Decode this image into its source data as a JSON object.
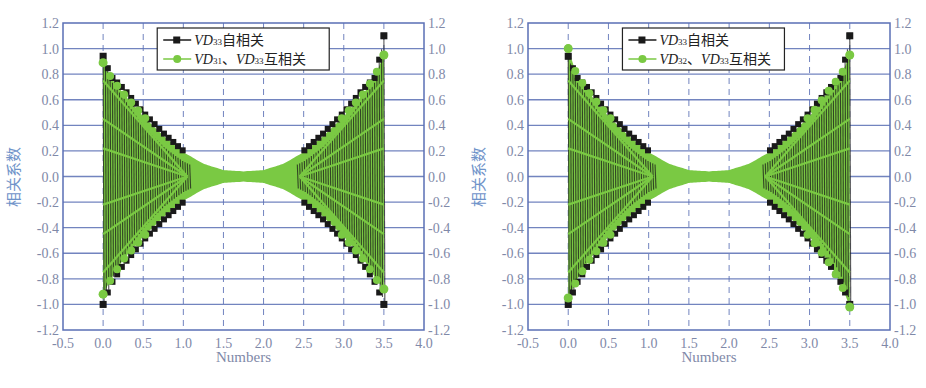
{
  "colors": {
    "axis": "#5a6fb5",
    "grid_h": "#5a6fb5",
    "grid_v": "#5a6fb5",
    "tick_text": "#7f89a8",
    "ylabel_text": "#6f93c9",
    "series_auto": "#1a1a1a",
    "series_cross": "#7ac943",
    "legend_border": "#222222"
  },
  "chart_data": [
    {
      "type": "line",
      "title": "",
      "xlabel": "Numbers",
      "ylabel": "相关系数",
      "xlim": [
        -0.5,
        4.0
      ],
      "ylim": [
        -1.2,
        1.2
      ],
      "xticks": [
        "-0.5",
        "0.0",
        "0.5",
        "1.0",
        "1.5",
        "2.0",
        "2.5",
        "3.0",
        "3.5",
        "4.0"
      ],
      "yticks": [
        "1.2",
        "1.0",
        "0.8",
        "0.6",
        "0.4",
        "0.2",
        "0.0",
        "-0.2",
        "-0.4",
        "-0.6",
        "-0.8",
        "-1.0",
        "-1.2"
      ],
      "grid": true,
      "legend_position": "top-center",
      "legend": [
        {
          "prefix": "VD",
          "sub": "33",
          "suffix": "自相关",
          "marker": "square"
        },
        {
          "prefix": "VD",
          "sub": "31",
          "mid": "、",
          "prefix2": "VD",
          "sub2": "33",
          "suffix": "互相关",
          "marker": "circle"
        }
      ],
      "series": [
        {
          "name": "VD33自相关",
          "envelope_x": [
            0.0,
            0.1,
            0.25,
            0.5,
            0.75,
            1.0,
            1.25,
            1.5,
            1.75,
            2.0,
            2.25,
            2.5,
            2.75,
            3.0,
            3.25,
            3.4,
            3.5
          ],
          "envelope_upper": [
            0.94,
            0.78,
            0.69,
            0.5,
            0.34,
            0.2,
            0.1,
            0.05,
            0.04,
            0.05,
            0.1,
            0.2,
            0.34,
            0.5,
            0.69,
            0.78,
            1.1
          ],
          "envelope_lower": [
            -1.0,
            -0.84,
            -0.69,
            -0.5,
            -0.34,
            -0.2,
            -0.1,
            -0.05,
            -0.04,
            -0.05,
            -0.1,
            -0.2,
            -0.34,
            -0.5,
            -0.69,
            -0.84,
            -1.0
          ]
        },
        {
          "name": "VD31、VD33互相关",
          "envelope_x": [
            0.0,
            0.1,
            0.25,
            0.5,
            0.75,
            1.0,
            1.25,
            1.5,
            1.75,
            2.0,
            2.25,
            2.5,
            2.75,
            3.0,
            3.25,
            3.4,
            3.5
          ],
          "envelope_upper": [
            0.89,
            0.77,
            0.65,
            0.47,
            0.32,
            0.19,
            0.1,
            0.05,
            0.04,
            0.05,
            0.1,
            0.19,
            0.32,
            0.47,
            0.65,
            0.8,
            0.95
          ],
          "envelope_lower": [
            -0.92,
            -0.8,
            -0.65,
            -0.47,
            -0.32,
            -0.19,
            -0.1,
            -0.05,
            -0.04,
            -0.05,
            -0.1,
            -0.19,
            -0.32,
            -0.47,
            -0.65,
            -0.8,
            -0.88
          ]
        }
      ]
    },
    {
      "type": "line",
      "title": "",
      "xlabel": "Numbers",
      "ylabel": "相关系数",
      "xlim": [
        -0.5,
        4.0
      ],
      "ylim": [
        -1.2,
        1.2
      ],
      "xticks": [
        "-0.5",
        "0.0",
        "0.5",
        "1.0",
        "1.5",
        "2.0",
        "2.5",
        "3.0",
        "3.5",
        "4.0"
      ],
      "yticks": [
        "1.2",
        "1.0",
        "0.8",
        "0.6",
        "0.4",
        "0.2",
        "0.0",
        "-0.2",
        "-0.4",
        "-0.6",
        "-0.8",
        "-1.0",
        "-1.2"
      ],
      "grid": true,
      "legend_position": "top-center",
      "legend": [
        {
          "prefix": "VD",
          "sub": "33",
          "suffix": "自相关",
          "marker": "square"
        },
        {
          "prefix": "VD",
          "sub": "32",
          "mid": "、",
          "prefix2": "VD",
          "sub2": "33",
          "suffix": "互相关",
          "marker": "circle"
        }
      ],
      "series": [
        {
          "name": "VD33自相关",
          "envelope_x": [
            0.0,
            0.1,
            0.25,
            0.5,
            0.75,
            1.0,
            1.25,
            1.5,
            1.75,
            2.0,
            2.25,
            2.5,
            2.75,
            3.0,
            3.25,
            3.4,
            3.5
          ],
          "envelope_upper": [
            0.94,
            0.78,
            0.69,
            0.5,
            0.34,
            0.2,
            0.1,
            0.05,
            0.04,
            0.05,
            0.1,
            0.2,
            0.34,
            0.5,
            0.69,
            0.78,
            1.1
          ],
          "envelope_lower": [
            -1.0,
            -0.84,
            -0.69,
            -0.5,
            -0.34,
            -0.2,
            -0.1,
            -0.05,
            -0.04,
            -0.05,
            -0.1,
            -0.2,
            -0.34,
            -0.5,
            -0.69,
            -0.84,
            -1.0
          ]
        },
        {
          "name": "VD32、VD33互相关",
          "envelope_x": [
            0.0,
            0.1,
            0.25,
            0.5,
            0.75,
            1.0,
            1.25,
            1.5,
            1.75,
            2.0,
            2.25,
            2.5,
            2.75,
            3.0,
            3.25,
            3.4,
            3.5
          ],
          "envelope_upper": [
            1.0,
            0.8,
            0.66,
            0.47,
            0.32,
            0.19,
            0.1,
            0.05,
            0.04,
            0.05,
            0.1,
            0.19,
            0.32,
            0.47,
            0.68,
            0.8,
            0.95
          ],
          "envelope_lower": [
            -0.95,
            -0.82,
            -0.66,
            -0.47,
            -0.32,
            -0.19,
            -0.1,
            -0.05,
            -0.04,
            -0.05,
            -0.1,
            -0.19,
            -0.32,
            -0.47,
            -0.68,
            -0.85,
            -1.02
          ]
        }
      ]
    }
  ]
}
